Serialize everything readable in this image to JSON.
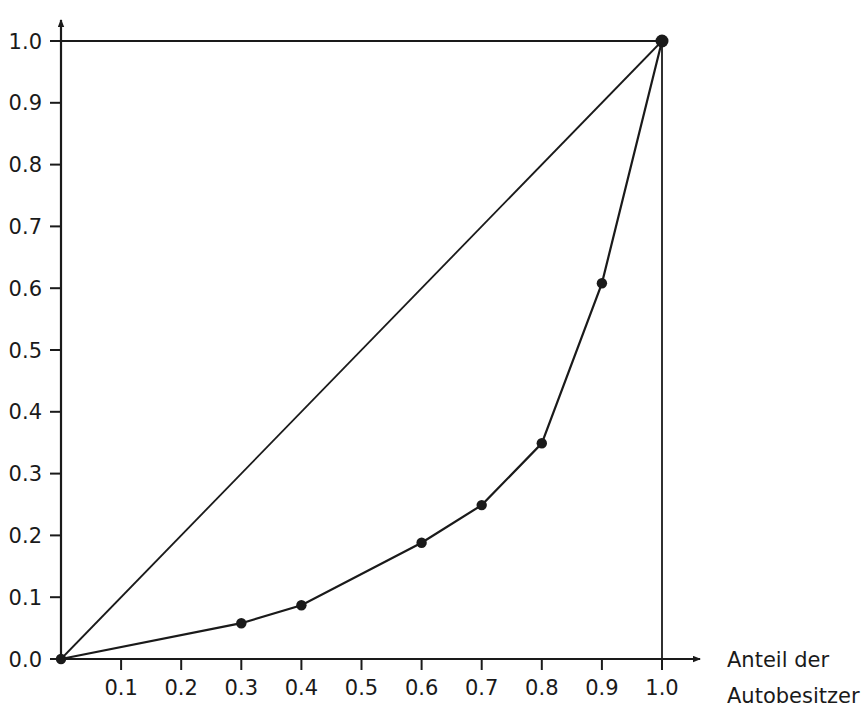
{
  "chart_data": {
    "type": "line",
    "title": "",
    "subtitle": "",
    "xlabel": "Anteil der Autobesitzer",
    "ylabel": "",
    "xlim": [
      0.0,
      1.0
    ],
    "ylim": [
      0.0,
      1.0
    ],
    "grid": false,
    "legend": "none",
    "x_tick_labels": [
      "0.1",
      "0.2",
      "0.3",
      "0.4",
      "0.5",
      "0.6",
      "0.7",
      "0.8",
      "0.9",
      "1.0"
    ],
    "x_tick_values": [
      0.1,
      0.2,
      0.3,
      0.4,
      0.5,
      0.6,
      0.7,
      0.8,
      0.9,
      1.0
    ],
    "y_tick_labels": [
      "0.0",
      "0.1",
      "0.2",
      "0.3",
      "0.4",
      "0.5",
      "0.6",
      "0.7",
      "0.8",
      "0.9",
      "1.0"
    ],
    "y_tick_values": [
      0.0,
      0.1,
      0.2,
      0.3,
      0.4,
      0.5,
      0.6,
      0.7,
      0.8,
      0.9,
      1.0
    ],
    "series": [
      {
        "name": "Lorenzkurve",
        "marker": "filled-circle",
        "x": [
          0.0,
          0.3,
          0.4,
          0.6,
          0.7,
          0.8,
          0.9,
          1.0
        ],
        "values": [
          0.0,
          0.058,
          0.087,
          0.188,
          0.249,
          0.349,
          0.608,
          1.0
        ]
      },
      {
        "name": "Gleichverteilungsgerade",
        "marker": "none",
        "x": [
          0.0,
          1.0
        ],
        "values": [
          0.0,
          1.0
        ]
      },
      {
        "name": "Obergrenze",
        "marker": "none",
        "x": [
          0.0,
          1.0
        ],
        "values": [
          1.0,
          1.0
        ]
      }
    ],
    "reference_lines": {
      "vertical_at_x": 1.0,
      "horizontal_at_y": 1.0
    },
    "colors": {
      "line": "#1a1a1a",
      "axis": "#1a1a1a",
      "marker": "#1a1a1a",
      "background": "#ffffff"
    }
  },
  "axis_caption": {
    "line1": "Anteil der",
    "line2": "Autobesitzer"
  }
}
